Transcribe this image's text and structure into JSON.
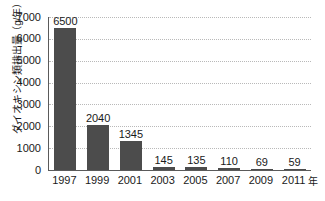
{
  "chart_data": {
    "type": "bar",
    "title": "",
    "xlabel": "年",
    "ylabel": "ダイオキシン類排出量（g/年）",
    "categories": [
      "1997",
      "1999",
      "2001",
      "2003",
      "2005",
      "2007",
      "2009",
      "2011"
    ],
    "values": [
      6500,
      2040,
      1345,
      145,
      135,
      110,
      69,
      59
    ],
    "value_labels": [
      "6500",
      "2040",
      "1345",
      "145",
      "135",
      "110",
      "69",
      "59"
    ],
    "ylim": [
      0,
      7000
    ],
    "ytick_labels": [
      "7000",
      "6000",
      "5000",
      "4000",
      "3000",
      "2000",
      "1000",
      "0"
    ],
    "ytick_values": [
      7000,
      6000,
      5000,
      4000,
      3000,
      2000,
      1000,
      0
    ],
    "grid": true,
    "legend": "none",
    "series": [
      {
        "name": "ダイオキシン類排出量",
        "values": [
          6500,
          2040,
          1345,
          145,
          135,
          110,
          69,
          59
        ]
      }
    ],
    "colors": {
      "bar": "#4c4c4c",
      "gridline": "#b9b9b9",
      "axis": "#5a5a5a",
      "text": "#1a1a1a",
      "background": "#ffffff"
    }
  }
}
